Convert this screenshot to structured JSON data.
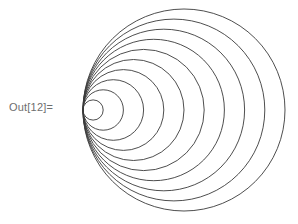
{
  "cell": {
    "output_label": "Out[12]="
  },
  "graphic": {
    "type": "nested-tangent-circles",
    "circle_count": 10,
    "tangent_point": [
      83,
      110
    ],
    "radius_step": 10.1,
    "stroke_color": "#3a3a3a",
    "background": "#ffffff"
  }
}
